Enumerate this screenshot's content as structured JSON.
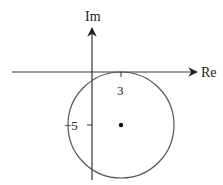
{
  "diagram": {
    "type": "complex-plane-circle",
    "axes": {
      "real_label": "Re",
      "imag_label": "Im"
    },
    "ticks": {
      "real_tick_label": "3",
      "imag_tick_label": "−5"
    },
    "circle": {
      "center": [
        3,
        -5
      ],
      "radius": 5,
      "tangent_to": "real axis"
    },
    "colors": {
      "stroke": "#333333",
      "circle_stroke": "#555555",
      "background": "#ffffff"
    }
  }
}
